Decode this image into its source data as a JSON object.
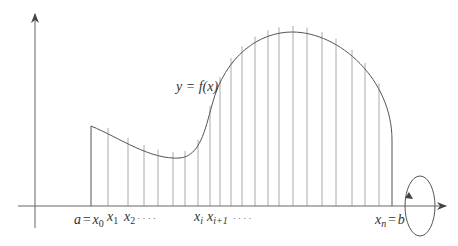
{
  "figure": {
    "curve_label": "y = f(x)",
    "rotation_indicator": "rotation about x-axis",
    "labels": {
      "a_eq_x0": {
        "a": "a",
        "eq": "=",
        "x": "x",
        "sub": "0"
      },
      "x1": {
        "x": "x",
        "sub": "1"
      },
      "x2": {
        "x": "x",
        "sub": "2",
        "dots": "· · · ·"
      },
      "xi": {
        "x": "x",
        "sub": "i"
      },
      "xi1": {
        "x": "x",
        "sub": "i+1",
        "dots": "· · · ·"
      },
      "xn_eq_b": {
        "x": "x",
        "sub": "n",
        "eq": "=",
        "b": "b"
      }
    },
    "colors": {
      "axis": "#555555",
      "curve": "#555555",
      "strip": "#aaaaaa",
      "text": "#333333"
    }
  }
}
